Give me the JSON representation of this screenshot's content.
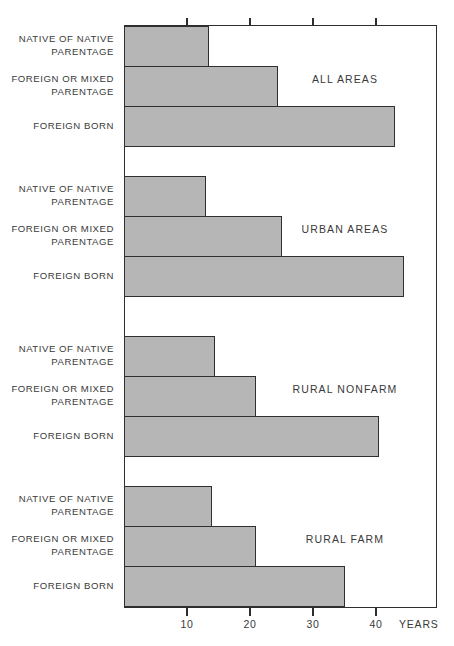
{
  "chart_data": {
    "type": "bar",
    "orientation": "horizontal",
    "title": "",
    "xlabel": "YEARS",
    "ylabel": "",
    "xlim": [
      0,
      49.7
    ],
    "xticks": [
      10,
      20,
      30,
      40
    ],
    "xtick_labels": [
      "10",
      "20",
      "30",
      "40"
    ],
    "grid": false,
    "legend": "none",
    "categories": [
      "NATIVE OF NATIVE\nPARENTAGE",
      "FOREIGN OR MIXED\nPARENTAGE",
      "FOREIGN BORN"
    ],
    "panels": [
      {
        "name": "ALL AREAS",
        "values": [
          13.5,
          24.5,
          43.0
        ]
      },
      {
        "name": "URBAN AREAS",
        "values": [
          13.0,
          25.0,
          44.5
        ]
      },
      {
        "name": "RURAL NONFARM",
        "values": [
          14.5,
          21.0,
          40.5
        ]
      },
      {
        "name": "RURAL FARM",
        "values": [
          14.0,
          21.0,
          35.0
        ]
      }
    ]
  },
  "axis": {
    "years_label": "YEARS",
    "tick_labels": [
      "10",
      "20",
      "30",
      "40"
    ]
  },
  "style": {
    "bar_fill": "#b6b6b6",
    "bar_stroke": "#2f2f2f",
    "frame_color": "#2e2e2e",
    "text_color": "#3a3a3a",
    "background": "#ffffff"
  }
}
